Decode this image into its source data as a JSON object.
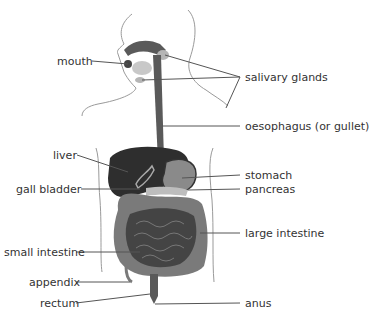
{
  "diagram": {
    "labels_left": [
      {
        "id": "mouth",
        "text": "mouth",
        "x": 57,
        "y": 55
      },
      {
        "id": "liver",
        "text": "liver",
        "x": 53,
        "y": 149
      },
      {
        "id": "gall-bladder",
        "text": "gall bladder",
        "x": 16,
        "y": 183
      },
      {
        "id": "small-intestine",
        "text": "small intestine",
        "x": 4,
        "y": 246
      },
      {
        "id": "appendix",
        "text": "appendix",
        "x": 29,
        "y": 276
      },
      {
        "id": "rectum",
        "text": "rectum",
        "x": 40,
        "y": 297
      }
    ],
    "labels_right": [
      {
        "id": "salivary-glands",
        "text": "salivary glands",
        "x": 245,
        "y": 71
      },
      {
        "id": "oesophagus",
        "text": "oesophagus (or gullet)",
        "x": 245,
        "y": 120
      },
      {
        "id": "stomach",
        "text": "stomach",
        "x": 245,
        "y": 169
      },
      {
        "id": "pancreas",
        "text": "pancreas",
        "x": 245,
        "y": 183
      },
      {
        "id": "large-intestine",
        "text": "large intestine",
        "x": 245,
        "y": 227
      },
      {
        "id": "anus",
        "text": "anus",
        "x": 245,
        "y": 297
      }
    ],
    "colors": {
      "organ_dark": "#2e2e2e",
      "organ_mid": "#6a6a6a",
      "organ_light": "#9a9a9a",
      "outline": "#8a8a8a",
      "leader": "#555555",
      "text": "#333333"
    }
  }
}
